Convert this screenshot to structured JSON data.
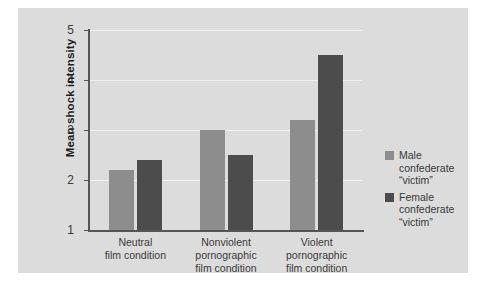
{
  "chart_data": {
    "type": "bar",
    "title": "",
    "subtitle": "",
    "xlabel": "",
    "ylabel": "Mean shock intensity",
    "ylim": [
      1,
      5
    ],
    "yticks": [
      "1",
      "2",
      "3",
      "4",
      "5"
    ],
    "grid": true,
    "legend_position": "right",
    "categories": [
      "Neutral\nfilm condition",
      "Nonviolent\npornographic\nfilm condition",
      "Violent\npornographic\nfilm condition"
    ],
    "series": [
      {
        "name": "Male\nconfederate\n“victim”",
        "color": "#8d8d8d",
        "values": [
          2.2,
          3.0,
          3.2
        ]
      },
      {
        "name": "Female\nconfederate\n“victim”",
        "color": "#4c4c4c",
        "values": [
          2.4,
          2.5,
          4.5
        ]
      }
    ]
  },
  "colors": {
    "panel_background": "#dcdcdc",
    "figure_background": "#ffffff",
    "axis": "#555555",
    "gridline": "#f0f0f0",
    "text": "#3a3a3a",
    "male_bar": "#8d8d8d",
    "female_bar": "#4c4c4c"
  }
}
